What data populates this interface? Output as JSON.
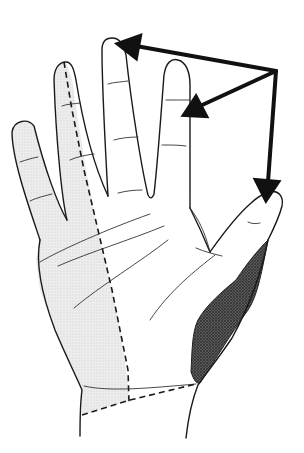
{
  "figure": {
    "regions": [
      {
        "name": "ulnar-region",
        "fill": "stippled light gray",
        "color": "#d9d9d9"
      },
      {
        "name": "thenar-region",
        "fill": "dense crosshatch dark gray",
        "color": "#4a4a4a"
      }
    ],
    "arrows": {
      "count": 3,
      "origin": [
        276,
        71
      ],
      "targets": [
        {
          "name": "middle-finger-tip",
          "point": [
            120,
            44
          ]
        },
        {
          "name": "ring-finger",
          "point": [
            188,
            114
          ]
        },
        {
          "name": "thumb-tip",
          "point": [
            266,
            198
          ]
        }
      ],
      "color": "#111111"
    },
    "dashed_lines": [
      "ulnar-boundary",
      "wrist-boundary"
    ]
  }
}
